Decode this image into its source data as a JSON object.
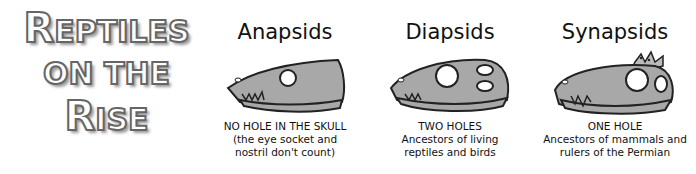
{
  "title": {
    "line1_first": "R",
    "line1_rest": "EPTILES",
    "line2": "ON THE",
    "line3_first": "R",
    "line3_rest": "ISE"
  },
  "columns": [
    {
      "heading": "Anapsids",
      "caption": [
        "NO HOLE IN THE SKULL",
        "(the eye socket and",
        "nostril don't count)"
      ],
      "skull": "skull-no-hole-icon"
    },
    {
      "heading": "Diapsids",
      "caption": [
        "TWO HOLES",
        "Ancestors of living",
        "reptiles and birds"
      ],
      "skull": "skull-two-holes-icon"
    },
    {
      "heading": "Synapsids",
      "caption": [
        "ONE HOLE",
        "Ancestors of mammals and",
        "rulers of the Permian"
      ],
      "skull": "skull-one-hole-crown-icon"
    }
  ],
  "colors": {
    "skull_fill": "#a8a8a8",
    "outline": "#222222",
    "title_fill": "#ffffff",
    "title_stroke": "#666666"
  }
}
